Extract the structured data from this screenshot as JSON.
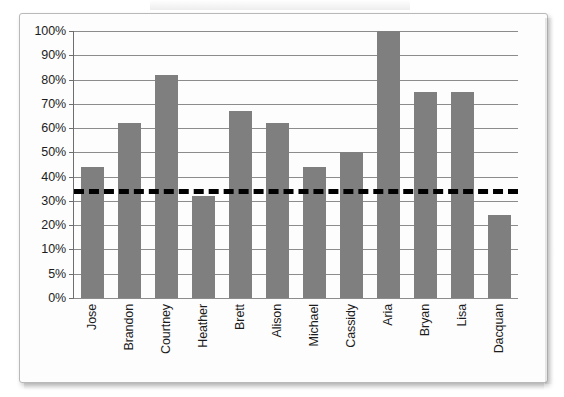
{
  "chart_data": {
    "type": "bar",
    "title": "",
    "subtitle": "",
    "xlabel": "",
    "ylabel": "",
    "categories": [
      "Jose",
      "Brandon",
      "Courtney",
      "Heather",
      "Brett",
      "Alison",
      "Michael",
      "Cassidy",
      "Aria",
      "Bryan",
      "Lisa",
      "Dacquan"
    ],
    "values": [
      44,
      62,
      82,
      32,
      67,
      62,
      44,
      50,
      100,
      75,
      75,
      24
    ],
    "value_suffix": "%",
    "series": [
      {
        "name": "Score",
        "values": [
          44,
          62,
          82,
          32,
          67,
          62,
          44,
          50,
          100,
          75,
          75,
          24
        ],
        "color": "#7f7f7f"
      }
    ],
    "ytick_labels": [
      "100%",
      "90%",
      "80%",
      "70%",
      "60%",
      "50%",
      "40%",
      "30%",
      "20%",
      "10%",
      "5%",
      "0%"
    ],
    "ytick_values": [
      100,
      90,
      80,
      70,
      60,
      50,
      40,
      30,
      20,
      10,
      5,
      0
    ],
    "ylim": [
      0,
      100
    ],
    "grid": "horizontal",
    "legend": "none",
    "annotations": [
      {
        "name": "goal-line",
        "type": "horizontal-dashed-line",
        "value": 35,
        "label": "",
        "color": "#000000",
        "style": "dashed"
      }
    ],
    "bar_color": "#7f7f7f",
    "gridline_color": "#8c8c8c",
    "axis_color": "#6e6e6e",
    "background_color": "#ffffff"
  }
}
